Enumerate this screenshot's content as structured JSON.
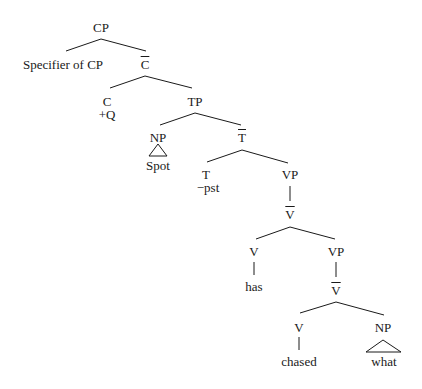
{
  "diagram": {
    "type": "syntax-tree",
    "nodes": {
      "cp": {
        "label": "CP"
      },
      "spec_cp": {
        "label": "Specifier of CP"
      },
      "c_bar": {
        "label": "C"
      },
      "c": {
        "label": "C",
        "feature": "+Q"
      },
      "tp": {
        "label": "TP"
      },
      "np_subj": {
        "label": "NP",
        "word": "Spot"
      },
      "t_bar": {
        "label": "T"
      },
      "t": {
        "label": "T",
        "feature": "−pst"
      },
      "vp1": {
        "label": "VP"
      },
      "v_bar1": {
        "label": "V"
      },
      "v1": {
        "label": "V",
        "word": "has"
      },
      "vp2": {
        "label": "VP"
      },
      "v_bar2": {
        "label": "V"
      },
      "v2": {
        "label": "V",
        "word": "chased"
      },
      "np_obj": {
        "label": "NP",
        "word": "what"
      }
    },
    "line_color": "#1a1a1a"
  }
}
